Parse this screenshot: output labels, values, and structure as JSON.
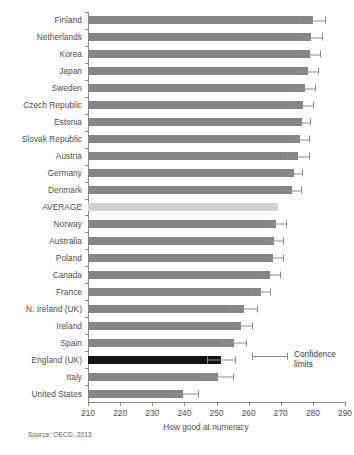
{
  "chart_data": {
    "type": "bar",
    "orientation": "horizontal",
    "title": "",
    "xlabel": "How good at numeracy",
    "ylabel": "",
    "xlim": [
      210,
      290
    ],
    "xticks": [
      210,
      220,
      230,
      240,
      250,
      260,
      270,
      280,
      290
    ],
    "grid": false,
    "legend": {
      "position": "inside-right",
      "entries": [
        {
          "label_line1": "Confidence",
          "label_line2": "limits",
          "symbol": "error-bar"
        }
      ]
    },
    "source": "Source: OECD, 2013",
    "colors": {
      "bar": "#858585",
      "average": "#d2d2d2",
      "highlight": "#121212",
      "axis": "#8d8d8d",
      "text": "#4f4f4f"
    },
    "categories": [
      "Finland",
      "Netherlands",
      "Korea",
      "Japan",
      "Sweden",
      "Czech Republic",
      "Estonia",
      "Slovak Republic",
      "Austria",
      "Germany",
      "Denmark",
      "AVERAGE",
      "Norway",
      "Australia",
      "Poland",
      "Canada",
      "France",
      "N. Ireland (UK)",
      "Ireland",
      "Spain",
      "England (UK)",
      "Italy",
      "United States"
    ],
    "values": [
      280.0,
      279.5,
      279.0,
      278.5,
      277.5,
      277.0,
      276.5,
      276.0,
      275.5,
      274.0,
      273.5,
      269.0,
      268.5,
      268.0,
      267.5,
      266.5,
      264.0,
      258.5,
      257.5,
      255.5,
      251.5,
      250.5,
      239.5
    ],
    "ci_upper": [
      284.0,
      283.0,
      282.5,
      282.0,
      281.0,
      280.5,
      279.5,
      279.0,
      279.0,
      277.0,
      276.5,
      269.0,
      272.0,
      271.0,
      271.0,
      270.0,
      267.0,
      263.0,
      261.5,
      259.5,
      256.0,
      255.5,
      244.5
    ],
    "series": [
      {
        "name": "Mean numeracy score",
        "values": [
          280.0,
          279.5,
          279.0,
          278.5,
          277.5,
          277.0,
          276.5,
          276.0,
          275.5,
          274.0,
          273.5,
          269.0,
          268.5,
          268.0,
          267.5,
          266.5,
          264.0,
          258.5,
          257.5,
          255.5,
          251.5,
          250.5,
          239.5
        ]
      }
    ],
    "highlight_category": "England (UK)",
    "average_category": "AVERAGE"
  }
}
